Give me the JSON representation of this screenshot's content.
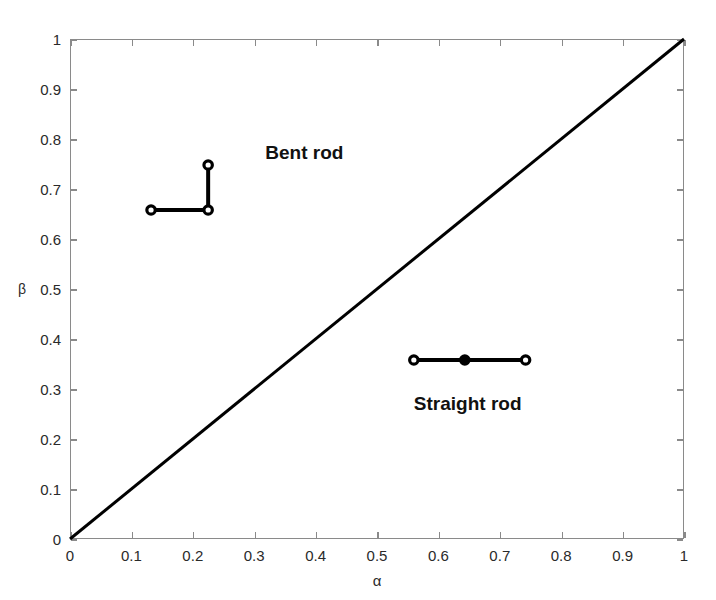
{
  "chart_data": {
    "type": "scatter",
    "title": "",
    "subtitle": "",
    "xlabel": "α",
    "ylabel": "β",
    "xlim": [
      0,
      1
    ],
    "ylim": [
      0,
      1
    ],
    "grid": false,
    "legend_position": "none",
    "xticks": [
      "0",
      "0.1",
      "0.2",
      "0.3",
      "0.4",
      "0.5",
      "0.6",
      "0.7",
      "0.8",
      "0.9",
      "1"
    ],
    "xtick_values": [
      0,
      0.1,
      0.2,
      0.3,
      0.4,
      0.5,
      0.6,
      0.7,
      0.8,
      0.9,
      1
    ],
    "yticks": [
      "0",
      "0.1",
      "0.2",
      "0.3",
      "0.4",
      "0.5",
      "0.6",
      "0.7",
      "0.8",
      "0.9",
      "1"
    ],
    "ytick_values": [
      0,
      0.1,
      0.2,
      0.3,
      0.4,
      0.5,
      0.6,
      0.7,
      0.8,
      0.9,
      1
    ],
    "reference_line": {
      "name": "diagonal",
      "from": [
        0,
        0
      ],
      "to": [
        1,
        1
      ],
      "color": "#000000",
      "width": 3
    },
    "series": [
      {
        "name": "Bent rod",
        "marker": "circle",
        "color": "#000000",
        "points": [
          {
            "x": 0.132,
            "y": 0.658,
            "filled": false
          },
          {
            "x": 0.225,
            "y": 0.658,
            "filled": false
          },
          {
            "x": 0.225,
            "y": 0.748,
            "filled": false
          }
        ],
        "connections": [
          [
            0,
            1
          ],
          [
            1,
            2
          ]
        ]
      },
      {
        "name": "Straight rod",
        "marker": "circle",
        "color": "#000000",
        "points": [
          {
            "x": 0.56,
            "y": 0.358,
            "filled": false
          },
          {
            "x": 0.643,
            "y": 0.358,
            "filled": true
          },
          {
            "x": 0.742,
            "y": 0.358,
            "filled": false
          }
        ],
        "connections": [
          [
            0,
            1
          ],
          [
            1,
            2
          ]
        ]
      }
    ],
    "annotations": [
      {
        "text": "Bent rod",
        "x": 0.318,
        "y": 0.77
      },
      {
        "text": "Straight rod",
        "x": 0.56,
        "y": 0.268
      }
    ]
  },
  "colors": {
    "axis": "#8a8a8a",
    "tick_text": "#2a2a2a",
    "data": "#000000",
    "background": "#ffffff"
  }
}
